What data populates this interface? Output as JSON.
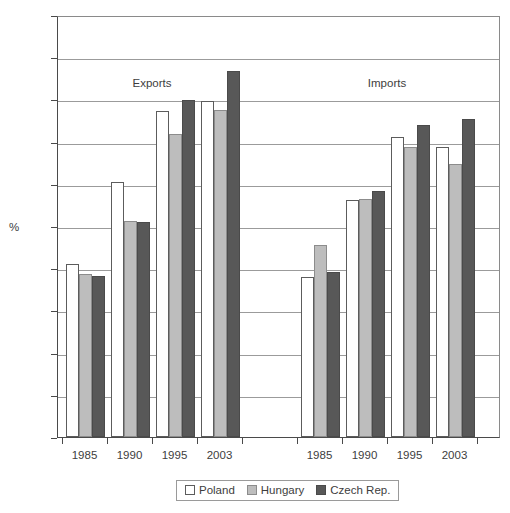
{
  "chart_data": {
    "type": "bar",
    "title": "",
    "xlabel": "",
    "ylabel": "%",
    "ylim": [
      0,
      100
    ],
    "ytick_step": 10,
    "yticks": [
      0,
      10,
      20,
      30,
      40,
      50,
      60,
      70,
      80,
      90,
      100
    ],
    "ytick_labels": [
      "0",
      "10",
      "20",
      "30",
      "40",
      "50",
      "60",
      "70",
      "80",
      "90",
      "100"
    ],
    "grid": true,
    "legend_position": "bottom",
    "sections": [
      {
        "name": "Exports",
        "categories": [
          "1985",
          "1990",
          "1995",
          "2003"
        ],
        "series": [
          {
            "name": "Poland",
            "values": [
              41.0,
              60.5,
              77.3,
              79.6
            ]
          },
          {
            "name": "Hungary",
            "values": [
              38.6,
              51.3,
              71.8,
              77.6
            ]
          },
          {
            "name": "Czech Rep.",
            "values": [
              38.2,
              51.0,
              79.8,
              86.7
            ]
          }
        ]
      },
      {
        "name": "Imports",
        "categories": [
          "1985",
          "1990",
          "1995",
          "2003"
        ],
        "series": [
          {
            "name": "Poland",
            "values": [
              38.0,
              56.2,
              71.2,
              68.7
            ]
          },
          {
            "name": "Hungary",
            "values": [
              45.6,
              56.3,
              68.8,
              64.7
            ]
          },
          {
            "name": "Czech Rep.",
            "values": [
              39.0,
              58.4,
              73.9,
              75.4
            ]
          }
        ]
      }
    ],
    "legend": [
      {
        "label": "Poland",
        "color": "#ffffff"
      },
      {
        "label": "Hungary",
        "color": "#bdbdbd"
      },
      {
        "label": "Czech Rep.",
        "color": "#585858"
      }
    ]
  }
}
